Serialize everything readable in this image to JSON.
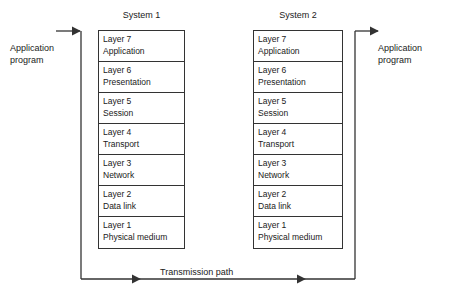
{
  "diagram": {
    "systems": [
      {
        "name": "System 1",
        "layers": [
          {
            "number": "Layer 7",
            "name": "Application"
          },
          {
            "number": "Layer 6",
            "name": "Presentation"
          },
          {
            "number": "Layer 5",
            "name": "Session"
          },
          {
            "number": "Layer 4",
            "name": "Transport"
          },
          {
            "number": "Layer 3",
            "name": "Network"
          },
          {
            "number": "Layer 2",
            "name": "Data link"
          },
          {
            "number": "Layer 1",
            "name": "Physical medium"
          }
        ]
      },
      {
        "name": "System 2",
        "layers": [
          {
            "number": "Layer 7",
            "name": "Application"
          },
          {
            "number": "Layer 6",
            "name": "Presentation"
          },
          {
            "number": "Layer 5",
            "name": "Session"
          },
          {
            "number": "Layer 4",
            "name": "Transport"
          },
          {
            "number": "Layer 3",
            "name": "Network"
          },
          {
            "number": "Layer 2",
            "name": "Data link"
          },
          {
            "number": "Layer 1",
            "name": "Physical medium"
          }
        ]
      }
    ],
    "endpoints": {
      "left": "Application\nprogram",
      "left_line1": "Application",
      "left_line2": "program",
      "right_line1": "Application",
      "right_line2": "program"
    },
    "transmission_path_label": "Transmission path",
    "colors": {
      "line": "#333333",
      "text": "#1a1a1a",
      "background": "#ffffff"
    }
  }
}
